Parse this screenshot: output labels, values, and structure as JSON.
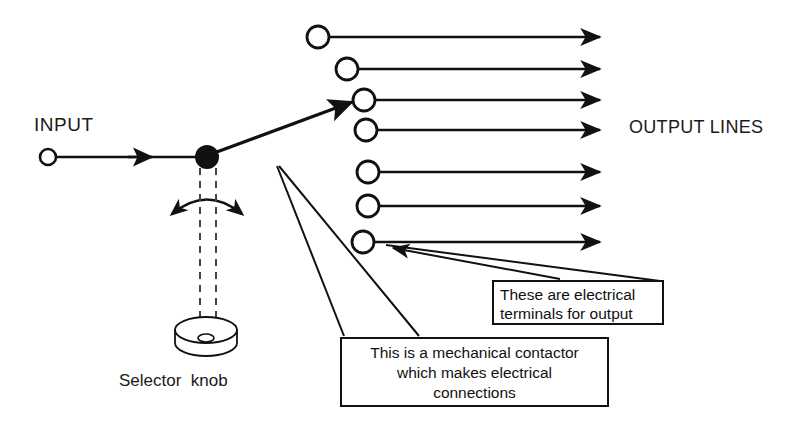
{
  "diagram": {
    "colors": {
      "stroke": "#111111",
      "text": "#1a1a1a",
      "background": "#ffffff",
      "dashed_shaft": "#444444"
    },
    "labels": {
      "input": "INPUT",
      "output_lines": "OUTPUT LINES",
      "selector_knob": "Selector  knob"
    },
    "callouts": [
      {
        "name": "terminals",
        "line1": "These are electrical",
        "line2": "terminals for output",
        "points_at": "output-terminal-7"
      },
      {
        "name": "contactor",
        "line1": "This is a mechanical contactor",
        "line2": "which makes electrical",
        "line3": "connections",
        "points_at": "contactor-pivot"
      }
    ],
    "input_terminal": {
      "cx": 48,
      "cy": 157,
      "r": 8
    },
    "pivot": {
      "cx": 207,
      "cy": 157,
      "r": 11
    },
    "contactor_arm": {
      "x1": 213,
      "y1": 153,
      "x2": 358,
      "y2": 100
    },
    "output_terminals": [
      {
        "index": 1,
        "cx": 318,
        "cy": 37,
        "r": 11,
        "line_end": 615
      },
      {
        "index": 2,
        "cx": 347,
        "cy": 69,
        "r": 11,
        "line_end": 615
      },
      {
        "index": 3,
        "cx": 364,
        "cy": 100,
        "r": 11,
        "line_end": 615
      },
      {
        "index": 4,
        "cx": 366,
        "cy": 130,
        "r": 11,
        "line_end": 615
      },
      {
        "index": 5,
        "cx": 368,
        "cy": 172,
        "r": 11,
        "line_end": 615
      },
      {
        "index": 6,
        "cx": 368,
        "cy": 206,
        "r": 11,
        "line_end": 615
      },
      {
        "index": 7,
        "cx": 363,
        "cy": 242,
        "r": 11,
        "line_end": 615
      }
    ],
    "output_terminal_count": 7,
    "knob": {
      "cx": 206,
      "cy": 330,
      "rx": 31,
      "ry": 13,
      "wall_height": 13,
      "hole_rx": 8,
      "hole_ry": 4
    },
    "shaft_dashed_lines": [
      {
        "x": 200,
        "y1": 168,
        "y2": 330
      },
      {
        "x": 216,
        "y1": 168,
        "y2": 322
      }
    ],
    "rotation_arc": {
      "from_x": 168,
      "to_x": 246,
      "baseline_y": 216,
      "apex_y": 192,
      "double_headed": true
    }
  }
}
